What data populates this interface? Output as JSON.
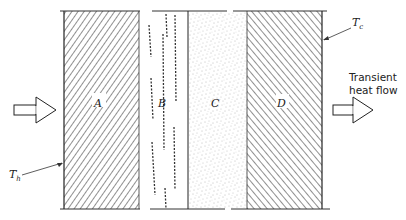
{
  "figure": {
    "layers": [
      {
        "id": "A",
        "label": "A",
        "fill": "hatch-forward"
      },
      {
        "id": "B",
        "label": "B",
        "fill": "dashed-streaks"
      },
      {
        "id": "C",
        "label": "C",
        "fill": "stipple"
      },
      {
        "id": "D",
        "label": "D",
        "fill": "hatch-backward"
      }
    ],
    "hot_side": {
      "symbol": "T",
      "subscript": "h"
    },
    "cold_side": {
      "symbol": "T",
      "subscript": "c"
    },
    "flow_label": {
      "line1": "Transient",
      "line2": "heat flow"
    },
    "arrows": [
      {
        "name": "heat-in-arrow",
        "direction": "right"
      },
      {
        "name": "heat-out-arrow",
        "direction": "right"
      }
    ],
    "colors": {
      "ink": "#222222",
      "background": "#ffffff"
    }
  }
}
